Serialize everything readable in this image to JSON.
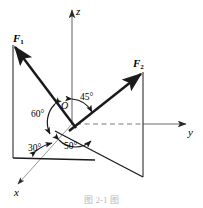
{
  "figure": {
    "caption": "图 2-1 图",
    "axes": [
      {
        "name": "z",
        "label": "z",
        "direction": "up"
      },
      {
        "name": "y",
        "label": "y",
        "direction": "right"
      },
      {
        "name": "x",
        "label": "x",
        "direction": "down-left"
      }
    ],
    "origin": {
      "label": "O",
      "x": 72,
      "y": 124
    },
    "forces": [
      {
        "name": "F1",
        "label": "F",
        "subscript": "1",
        "tip": {
          "x": 13,
          "y": 45
        }
      },
      {
        "name": "F2",
        "label": "F",
        "subscript": "2",
        "tip": {
          "x": 143,
          "y": 72
        }
      }
    ],
    "angles": [
      {
        "name": "angle-60",
        "label": "60°",
        "between": "F1-and-z-axis"
      },
      {
        "name": "angle-30",
        "label": "30°",
        "between": "F1-projection-and-x-axis"
      },
      {
        "name": "angle-45",
        "label": "45°",
        "between": "z-axis-and-F2"
      },
      {
        "name": "angle-50",
        "label": "50°",
        "between": "x-axis-and-F2-projection"
      }
    ],
    "colors": {
      "stroke": "#1a1a1a",
      "thin_stroke": "#6e6e6e",
      "dashed": "#7a7a7a",
      "background": "#ffffff",
      "caption": "#b9b9b9"
    }
  }
}
